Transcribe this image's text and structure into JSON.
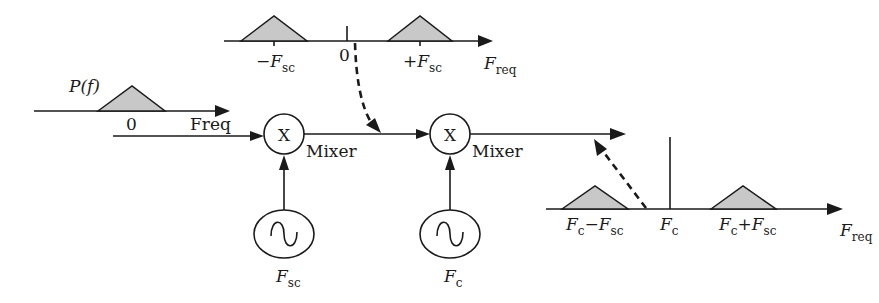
{
  "diagram": {
    "type": "signal-flow / frequency translation",
    "input_spectrum": {
      "function_label": "P(f)",
      "zero_label": "0",
      "axis_label": "Freq"
    },
    "mixer1": {
      "symbol": "X",
      "label": "Mixer",
      "oscillator_label_main": "F",
      "oscillator_label_sub": "sc"
    },
    "mixer2": {
      "symbol": "X",
      "label": "Mixer",
      "oscillator_label_main": "F",
      "oscillator_label_sub": "c"
    },
    "intermediate_spectrum": {
      "neg_label_main": "−F",
      "neg_label_sub": "sc",
      "zero_label": "0",
      "pos_label_main": "+F",
      "pos_label_sub": "sc",
      "axis_label_main": "F",
      "axis_label_sub": "req"
    },
    "output_spectrum": {
      "lower_label_main": "F",
      "lower_label_sub1": "c",
      "lower_label_mid": "−F",
      "lower_label_sub2": "sc",
      "carrier_label_main": "F",
      "carrier_label_sub": "c",
      "upper_label_main": "F",
      "upper_label_sub1": "c",
      "upper_label_mid": "+F",
      "upper_label_sub2": "sc",
      "axis_label_main": "F",
      "axis_label_sub": "req"
    },
    "colors": {
      "stroke": "#1a1a1a",
      "spectrum_fill": "#c8c8c8",
      "background": "#ffffff"
    }
  }
}
